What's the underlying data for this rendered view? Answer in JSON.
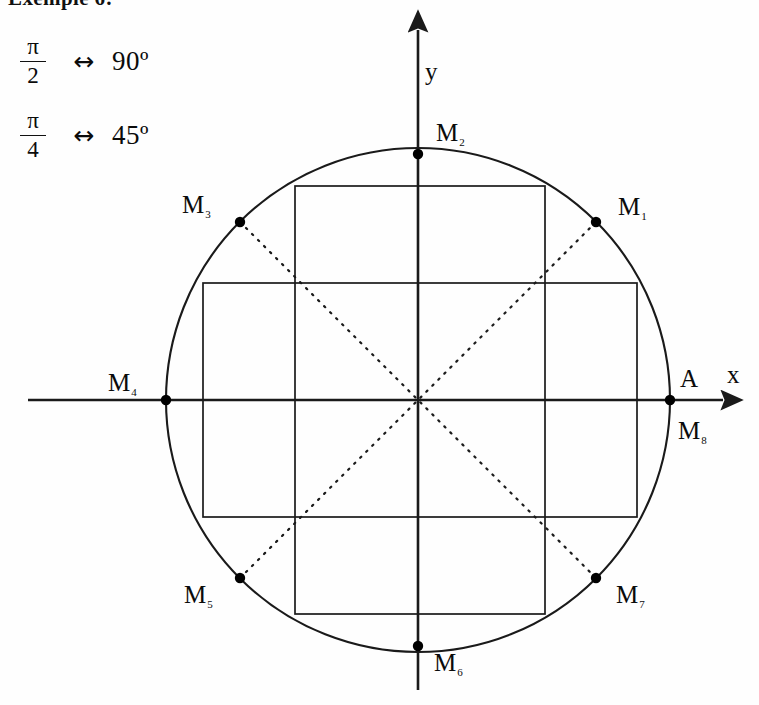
{
  "heading": {
    "text": "Exemple 6:",
    "clipped": true
  },
  "equivalences": [
    {
      "fraction_numerator": "π",
      "fraction_denominator": "2",
      "arrow": "↔",
      "degrees": "90º"
    },
    {
      "fraction_numerator": "π",
      "fraction_denominator": "4",
      "arrow": "↔",
      "degrees": "45º"
    }
  ],
  "axes": {
    "x_label": "x",
    "y_label": "y",
    "origin_label": ""
  },
  "chart_data": {
    "type": "scatter",
    "title": "",
    "xlabel": "x",
    "ylabel": "y",
    "grid": false,
    "legend": "none",
    "geometry": {
      "center_px": [
        418,
        400
      ],
      "radius_px": 252,
      "circle_stroke": "#1a1a1a",
      "axis_stroke": "#1a1a1a",
      "rect_stroke": "#1a1a1a",
      "diagonal_style": "dotted",
      "point_fill": "#000000"
    },
    "points": [
      {
        "label": "M",
        "subscript": "1",
        "angle_deg": 45,
        "x": 0.7071,
        "y": 0.7071,
        "px": [
          596,
          222
        ]
      },
      {
        "label": "M",
        "subscript": "2",
        "angle_deg": 90,
        "x": 0.0,
        "y": 1.0,
        "px": [
          418,
          154
        ]
      },
      {
        "label": "M",
        "subscript": "3",
        "angle_deg": 135,
        "x": -0.7071,
        "y": 0.7071,
        "px": [
          240,
          222
        ]
      },
      {
        "label": "M",
        "subscript": "4",
        "angle_deg": 180,
        "x": -1.0,
        "y": 0.0,
        "px": [
          166,
          400
        ]
      },
      {
        "label": "M",
        "subscript": "5",
        "angle_deg": 225,
        "x": -0.7071,
        "y": -0.7071,
        "px": [
          240,
          578
        ]
      },
      {
        "label": "M",
        "subscript": "6",
        "angle_deg": 270,
        "x": 0.0,
        "y": -1.0,
        "px": [
          418,
          646
        ]
      },
      {
        "label": "M",
        "subscript": "7",
        "angle_deg": 315,
        "x": 0.7071,
        "y": -0.7071,
        "px": [
          596,
          578
        ]
      },
      {
        "label": "M",
        "subscript": "8",
        "angle_deg": 360,
        "x": 1.0,
        "y": 0.0,
        "px": [
          670,
          400
        ]
      }
    ],
    "extra_labels": [
      {
        "label": "A",
        "angle_deg": 0,
        "x": 1.0,
        "y": 0.0,
        "px": [
          670,
          400
        ],
        "note": "start point of the circle, same location as M8"
      }
    ],
    "rectangles": [
      {
        "name": "tall-rectangle",
        "x_px": [
          295,
          545
        ],
        "y_px": [
          186,
          614
        ]
      },
      {
        "name": "wide-rectangle",
        "x_px": [
          203,
          637
        ],
        "y_px": [
          283,
          517
        ]
      }
    ],
    "diagonals": [
      {
        "name": "diagonal-m3-m7",
        "from": "M3",
        "to": "M7",
        "style": "dotted"
      },
      {
        "name": "diagonal-m5-m1",
        "from": "M5",
        "to": "M1",
        "style": "dotted"
      }
    ]
  }
}
